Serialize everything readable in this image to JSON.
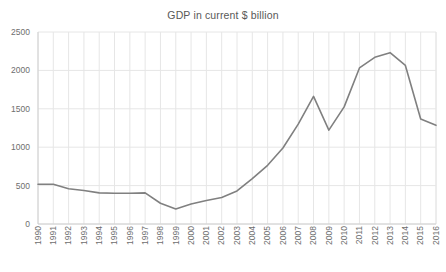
{
  "chart_data": {
    "type": "line",
    "title": "GDP in current $ billion",
    "xlabel": "",
    "ylabel": "",
    "ylim": [
      0,
      2500
    ],
    "ytick_step": 500,
    "yticks": [
      0,
      500,
      1000,
      1500,
      2000,
      2500
    ],
    "ytick_labels": [
      "0",
      "500",
      "1000",
      "1500",
      "2000",
      "2500"
    ],
    "grid": true,
    "grid_axis": "both",
    "legend": false,
    "legend_position": "none",
    "line_color": "#808080",
    "grid_color": "#e6e6e6",
    "text_color": "#6e6e6e",
    "categories": [
      "1990",
      "1991",
      "1992",
      "1993",
      "1994",
      "1995",
      "1996",
      "1997",
      "1998",
      "1999",
      "2000",
      "2001",
      "2002",
      "2003",
      "2004",
      "2005",
      "2006",
      "2007",
      "2008",
      "2009",
      "2010",
      "2011",
      "2012",
      "2013",
      "2014",
      "2015",
      "2016"
    ],
    "values": [
      517,
      518,
      460,
      436,
      405,
      400,
      400,
      405,
      270,
      196,
      260,
      307,
      345,
      430,
      591,
      764,
      990,
      1300,
      1661,
      1223,
      1525,
      2032,
      2170,
      2231,
      2064,
      1366,
      1285
    ],
    "series": [
      {
        "name": "GDP in current $ billion",
        "values": [
          517,
          518,
          460,
          436,
          405,
          400,
          400,
          405,
          270,
          196,
          260,
          307,
          345,
          430,
          591,
          764,
          990,
          1300,
          1661,
          1223,
          1525,
          2032,
          2170,
          2231,
          2064,
          1366,
          1285
        ]
      }
    ],
    "annotations": []
  }
}
